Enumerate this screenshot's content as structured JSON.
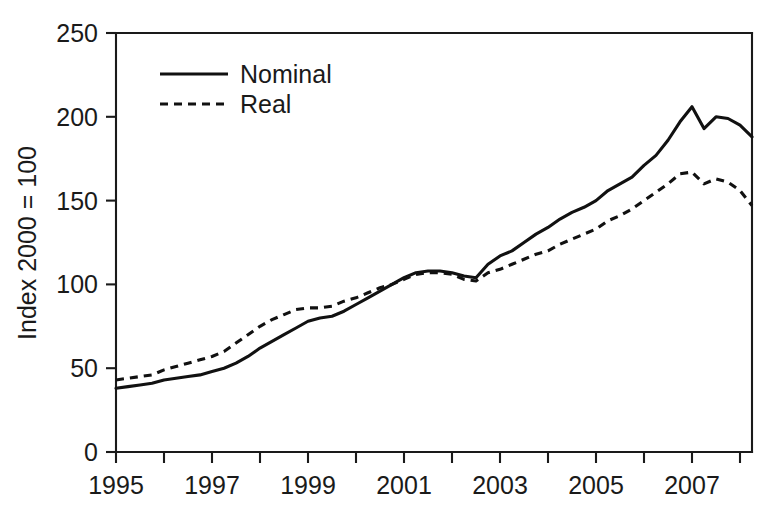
{
  "chart_data": {
    "type": "line",
    "title": "",
    "subtitle": "",
    "xlabel": "",
    "ylabel": "Index 2000 = 100",
    "xlim": [
      1995,
      2008.25
    ],
    "ylim": [
      0,
      250
    ],
    "grid": false,
    "legend_position": "top-left-inside",
    "x_tick_labels": [
      "1995",
      "1997",
      "1999",
      "2001",
      "2003",
      "2005",
      "2007"
    ],
    "x_ticks": [
      1995,
      1997,
      1999,
      2001,
      2003,
      2005,
      2007
    ],
    "x_minor_ticks": [
      1996,
      1998,
      2000,
      2002,
      2004,
      2006,
      2008
    ],
    "y_tick_labels": [
      "0",
      "50",
      "100",
      "150",
      "200",
      "250"
    ],
    "y_ticks": [
      0,
      50,
      100,
      150,
      200,
      250
    ],
    "line_color": "#111111",
    "axis_color": "#1a1a1a",
    "background_color": "#ffffff",
    "x": [
      1995.0,
      1995.25,
      1995.5,
      1995.75,
      1996.0,
      1996.25,
      1996.5,
      1996.75,
      1997.0,
      1997.25,
      1997.5,
      1997.75,
      1998.0,
      1998.25,
      1998.5,
      1998.75,
      1999.0,
      1999.25,
      1999.5,
      1999.75,
      2000.0,
      2000.25,
      2000.5,
      2000.75,
      2001.0,
      2001.25,
      2001.5,
      2001.75,
      2002.0,
      2002.25,
      2002.5,
      2002.75,
      2003.0,
      2003.25,
      2003.5,
      2003.75,
      2004.0,
      2004.25,
      2004.5,
      2004.75,
      2005.0,
      2005.25,
      2005.5,
      2005.75,
      2006.0,
      2006.25,
      2006.5,
      2006.75,
      2007.0,
      2007.25,
      2007.5,
      2007.75,
      2008.0,
      2008.25
    ],
    "series": [
      {
        "name": "Nominal",
        "style": "solid",
        "values": [
          38,
          39,
          40,
          41,
          43,
          44,
          45,
          46,
          48,
          50,
          53,
          57,
          62,
          66,
          70,
          74,
          78,
          80,
          81,
          84,
          88,
          92,
          96,
          100,
          104,
          107,
          108,
          108,
          107,
          105,
          104,
          112,
          117,
          120,
          125,
          130,
          134,
          139,
          143,
          146,
          150,
          156,
          160,
          164,
          171,
          177,
          186,
          197,
          206,
          193,
          200,
          199,
          195,
          188
        ]
      },
      {
        "name": "Real",
        "style": "dashed",
        "values": [
          43,
          44,
          45,
          46,
          49,
          51,
          53,
          55,
          57,
          60,
          65,
          70,
          75,
          79,
          82,
          85,
          86,
          86,
          87,
          90,
          92,
          95,
          98,
          100,
          103,
          106,
          107,
          107,
          106,
          103,
          102,
          107,
          109,
          112,
          115,
          118,
          120,
          124,
          127,
          130,
          133,
          138,
          141,
          145,
          150,
          155,
          160,
          166,
          167,
          160,
          163,
          161,
          156,
          147
        ]
      }
    ]
  },
  "legend": {
    "items": [
      {
        "label": "Nominal",
        "style": "solid"
      },
      {
        "label": "Real",
        "style": "dashed"
      }
    ]
  },
  "axes": {
    "y_title": "Index 2000 = 100"
  }
}
